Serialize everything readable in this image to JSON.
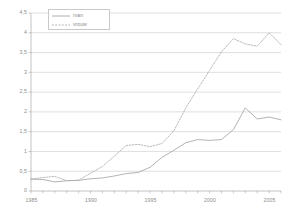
{
  "chart_data": {
    "type": "line",
    "title": "",
    "subtitle": "",
    "xlabel": "",
    "ylabel": "",
    "xlim": [
      1985,
      2006
    ],
    "ylim": [
      0,
      4.5
    ],
    "ytick_step": 0.5,
    "xtick_step": 1,
    "xtick_label_step": 5,
    "grid": "horizontal",
    "legend_position": "top-left-inside",
    "decimal_separator": ",",
    "x": [
      1985,
      1986,
      1987,
      1988,
      1989,
      1990,
      1991,
      1992,
      1993,
      1994,
      1995,
      1996,
      1997,
      1998,
      1999,
      2000,
      2001,
      2002,
      2003,
      2004,
      2005,
      2006
    ],
    "xtick_labels": [
      "1985",
      "1990",
      "1995",
      "2000",
      "2005"
    ],
    "xtick_label_values": [
      1985,
      1990,
      1995,
      2000,
      2005
    ],
    "ytick_labels": [
      "0",
      "0,5",
      "1",
      "1,5",
      "2",
      "2,5",
      "3",
      "3,5",
      "4",
      "4,5"
    ],
    "ytick_values": [
      0,
      0.5,
      1,
      1.5,
      2,
      2.5,
      3,
      3.5,
      4,
      4.5
    ],
    "series": [
      {
        "name": "man",
        "style": "solid",
        "color": "#9a9a9a",
        "values": [
          0.3,
          0.29,
          0.23,
          0.26,
          0.27,
          0.31,
          0.33,
          0.38,
          0.44,
          0.47,
          0.6,
          0.85,
          1.03,
          1.22,
          1.3,
          1.28,
          1.3,
          1.55,
          2.1,
          1.82,
          1.87,
          1.8
        ]
      },
      {
        "name": "vrouw",
        "style": "dotted",
        "color": "#a8a8a8",
        "values": [
          0.3,
          0.34,
          0.37,
          0.26,
          0.27,
          0.45,
          0.62,
          0.88,
          1.15,
          1.18,
          1.12,
          1.2,
          1.52,
          2.1,
          2.58,
          3.05,
          3.52,
          3.85,
          3.72,
          3.66,
          4.0,
          3.7
        ]
      }
    ]
  },
  "legend": {
    "entries": [
      {
        "label": "man",
        "icon": "solid-line-swatch"
      },
      {
        "label": "vrouw",
        "icon": "dotted-line-swatch"
      }
    ]
  },
  "colors": {
    "grid": "#bfbfbf",
    "axis": "#9a9a9a",
    "text": "#8d8d8d",
    "man": "#9a9a9a",
    "vrouw": "#a8a8a8",
    "background": "#ffffff"
  }
}
